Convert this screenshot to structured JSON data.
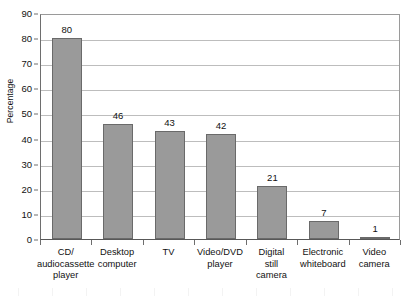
{
  "chart_data": {
    "type": "bar",
    "title": "",
    "xlabel": "",
    "ylabel": "Percentage",
    "ylim": [
      0,
      90
    ],
    "ytick_step": 10,
    "yticks": [
      0,
      10,
      20,
      30,
      40,
      50,
      60,
      70,
      80,
      90
    ],
    "grid": true,
    "legend": false,
    "categories": [
      "CD/\naudiocassette\nplayer",
      "Desktop\ncomputer",
      "TV",
      "Video/DVD\nplayer",
      "Digital\nstill\ncamera",
      "Electronic\nwhiteboard",
      "Video\ncamera"
    ],
    "category_lines": [
      [
        "CD/",
        "audiocassette",
        "player"
      ],
      [
        "Desktop",
        "computer"
      ],
      [
        "TV"
      ],
      [
        "Video/DVD",
        "player"
      ],
      [
        "Digital",
        "still",
        "camera"
      ],
      [
        "Electronic",
        "whiteboard"
      ],
      [
        "Video",
        "camera"
      ]
    ],
    "values": [
      80,
      46,
      43,
      42,
      21,
      7,
      1
    ],
    "value_labels": [
      "80",
      "46",
      "43",
      "42",
      "21",
      "7",
      "1"
    ],
    "colors": {
      "bar_fill": "#9a9a9a",
      "bar_edge": "#6a6a6a",
      "gridline": "#bdbdbd",
      "axis": "#585858",
      "text": "#111111",
      "background": "#ffffff"
    }
  }
}
